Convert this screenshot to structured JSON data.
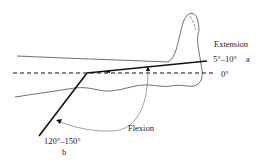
{
  "diagram": {
    "labels": {
      "extension": "Extension",
      "extension_range": "5°–10°",
      "extension_marker": "a",
      "zero": "0°",
      "flexion": "Flexion",
      "flexion_range": "120°–150°",
      "flexion_marker": "b"
    },
    "colors": {
      "line": "#111111",
      "outline": "#333333",
      "arc": "#777777",
      "background": "#ffffff"
    }
  }
}
